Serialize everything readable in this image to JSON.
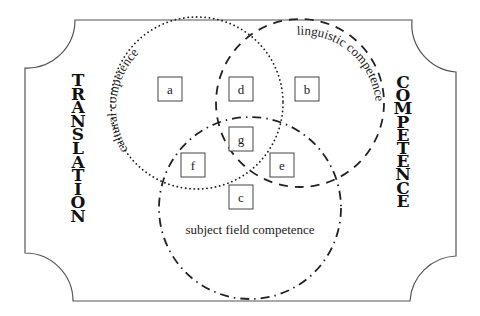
{
  "diagram": {
    "type": "venn",
    "left_title": "TRANSLATION",
    "right_title": "COMPETENCE",
    "circles": [
      {
        "id": "cultural",
        "label": "cultural competence",
        "style": "dotted"
      },
      {
        "id": "linguistic",
        "label": "linguistic competence",
        "style": "dashed"
      },
      {
        "id": "subject",
        "label": "subject field competence",
        "style": "dash-dot"
      }
    ],
    "regions": [
      {
        "id": "a",
        "label": "a",
        "sets": [
          "cultural"
        ]
      },
      {
        "id": "b",
        "label": "b",
        "sets": [
          "linguistic"
        ]
      },
      {
        "id": "c",
        "label": "c",
        "sets": [
          "subject"
        ]
      },
      {
        "id": "d",
        "label": "d",
        "sets": [
          "cultural",
          "linguistic"
        ]
      },
      {
        "id": "e",
        "label": "e",
        "sets": [
          "linguistic",
          "subject"
        ]
      },
      {
        "id": "f",
        "label": "f",
        "sets": [
          "cultural",
          "subject"
        ]
      },
      {
        "id": "g",
        "label": "g",
        "sets": [
          "cultural",
          "linguistic",
          "subject"
        ]
      }
    ],
    "colors": {
      "stroke": "#222222",
      "background": "#ffffff"
    }
  }
}
